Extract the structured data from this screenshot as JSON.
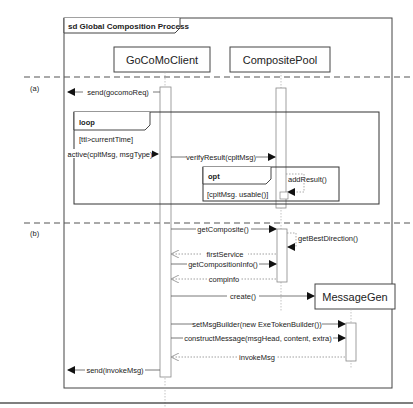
{
  "diagram": {
    "type": "UML sequence diagram",
    "frame_title": "sd Global Composition Process",
    "lifelines": [
      {
        "id": "client",
        "label": "GoCoMoClient"
      },
      {
        "id": "pool",
        "label": "CompositePool"
      },
      {
        "id": "gen",
        "label": "MessageGen"
      }
    ],
    "sections": [
      {
        "label": "(a)"
      },
      {
        "label": "(b)"
      }
    ],
    "fragments": {
      "loop": {
        "operator": "loop",
        "guard": "[ttl>currentTime]"
      },
      "opt": {
        "operator": "opt",
        "guard": "[cpltMsg. usable()]"
      }
    },
    "messages": [
      {
        "label": "send(gocomoReq)",
        "from": "client",
        "to": "frame",
        "kind": "sync"
      },
      {
        "label": "active(cpltMsg, msgType)",
        "from": "frame",
        "to": "client",
        "kind": "sync"
      },
      {
        "label": "verifyResult(cpltMsg)",
        "from": "client",
        "to": "pool",
        "kind": "sync"
      },
      {
        "label": "addResult()",
        "from": "pool",
        "to": "pool",
        "kind": "self"
      },
      {
        "label": "getComposite()",
        "from": "client",
        "to": "pool",
        "kind": "sync"
      },
      {
        "label": "getBestDirection()",
        "from": "pool",
        "to": "pool",
        "kind": "self"
      },
      {
        "label": "firstService",
        "from": "pool",
        "to": "client",
        "kind": "return"
      },
      {
        "label": "getCompositionInfo()",
        "from": "client",
        "to": "pool",
        "kind": "sync"
      },
      {
        "label": "compinfo",
        "from": "pool",
        "to": "client",
        "kind": "return"
      },
      {
        "label": "create()",
        "from": "client",
        "to": "gen",
        "kind": "create"
      },
      {
        "label": "setMsgBuilder(new ExeTokenBuilder())",
        "from": "client",
        "to": "gen",
        "kind": "sync"
      },
      {
        "label": "constructMessage(msgHead, content, extra)",
        "from": "client",
        "to": "gen",
        "kind": "sync"
      },
      {
        "label": "invokeMsg",
        "from": "gen",
        "to": "client",
        "kind": "return"
      },
      {
        "label": "send(invokeMsg)",
        "from": "client",
        "to": "frame",
        "kind": "sync"
      }
    ]
  }
}
